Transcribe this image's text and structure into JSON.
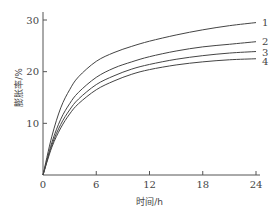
{
  "chart_data": {
    "type": "line",
    "title": "",
    "xlabel": "时间/h",
    "ylabel": "膨胀率/%",
    "xlim": [
      0,
      24
    ],
    "ylim": [
      0,
      30
    ],
    "xticks": [
      0,
      6,
      12,
      18,
      24
    ],
    "yticks": [
      10,
      20,
      30
    ],
    "x_origin_label": "0",
    "grid": false,
    "legend": "inline labels at right end of curves",
    "x": [
      0,
      1,
      2,
      3,
      4,
      6,
      8,
      10,
      12,
      15,
      18,
      21,
      24
    ],
    "series": [
      {
        "name": "1",
        "values": [
          0,
          7.5,
          13.0,
          16.5,
          19.0,
          22.0,
          23.7,
          24.9,
          25.9,
          27.1,
          28.1,
          28.9,
          29.5
        ]
      },
      {
        "name": "2",
        "values": [
          0,
          6.3,
          10.8,
          13.8,
          16.0,
          18.9,
          20.7,
          21.9,
          22.9,
          24.0,
          24.8,
          25.3,
          25.8
        ]
      },
      {
        "name": "3",
        "values": [
          0,
          5.8,
          9.8,
          12.6,
          14.7,
          17.5,
          19.2,
          20.5,
          21.4,
          22.4,
          23.1,
          23.6,
          23.9
        ]
      },
      {
        "name": "4",
        "values": [
          0,
          5.4,
          9.1,
          11.8,
          13.8,
          16.5,
          18.2,
          19.5,
          20.4,
          21.3,
          21.9,
          22.3,
          22.5
        ]
      }
    ]
  }
}
